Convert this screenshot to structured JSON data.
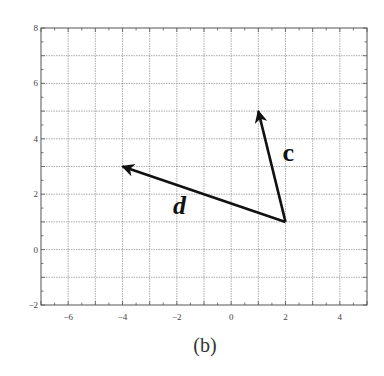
{
  "chart_data": {
    "type": "line",
    "title": "",
    "caption": "(b)",
    "xlabel": "",
    "ylabel": "",
    "xlim": [
      -7,
      5
    ],
    "ylim": [
      -2,
      8
    ],
    "grid": true,
    "x_ticks": [
      -6,
      -4,
      -2,
      0,
      2,
      4
    ],
    "x_tick_labels": [
      "−6",
      "−4",
      "−2",
      "0",
      "2",
      "4"
    ],
    "y_ticks": [
      -2,
      0,
      2,
      4,
      6,
      8
    ],
    "y_tick_labels": [
      "−2",
      "0",
      "2",
      "4",
      "6",
      "8"
    ],
    "series": [
      {
        "name": "c",
        "label_style": "bold",
        "from": [
          2,
          1
        ],
        "to": [
          1,
          5
        ],
        "label_pos": [
          2.1,
          3.2
        ]
      },
      {
        "name": "d",
        "label_style": "bold-italic",
        "from": [
          2,
          1
        ],
        "to": [
          -4,
          3
        ],
        "label_pos": [
          -1.9,
          1.3
        ]
      }
    ],
    "legend": null
  },
  "colors": {
    "grid": "#888888",
    "axis": "#555555",
    "vector": "#111111"
  }
}
